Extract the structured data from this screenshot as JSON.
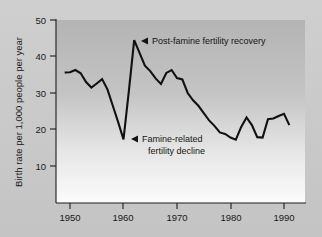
{
  "figure": {
    "background_color": "#c9c9c9",
    "plot_background_top": "#b6b6b6",
    "plot_background_bottom": "#fbfbfb",
    "line_color": "#111111",
    "axis_color": "#1a1a1a"
  },
  "chart_data": {
    "type": "line",
    "title": "",
    "subtitle": "",
    "xlabel": "",
    "ylabel": "Birth rate per 1,000 people per year",
    "xlim": [
      1948,
      1992
    ],
    "ylim": [
      0,
      50
    ],
    "ytick_labels": [
      "10",
      "20",
      "30",
      "40",
      "50"
    ],
    "ytick_values": [
      10,
      20,
      30,
      40,
      50
    ],
    "xtick_labels": [
      "1950",
      "1960",
      "1970",
      "1980",
      "1990"
    ],
    "xtick_values": [
      1950,
      1960,
      1970,
      1980,
      1990
    ],
    "grid": false,
    "legend": null,
    "series": [
      {
        "name": "Birth rate",
        "x": [
          1949,
          1950,
          1951,
          1952,
          1953,
          1954,
          1955,
          1956,
          1957,
          1958,
          1959,
          1960,
          1961,
          1962,
          1963,
          1964,
          1965,
          1966,
          1967,
          1968,
          1969,
          1970,
          1971,
          1972,
          1973,
          1974,
          1975,
          1976,
          1977,
          1978,
          1979,
          1980,
          1981,
          1982,
          1983,
          1984,
          1985,
          1986,
          1987,
          1988,
          1989,
          1990,
          1991
        ],
        "values": [
          35.6,
          35.7,
          36.3,
          35.4,
          33.0,
          31.5,
          32.6,
          33.8,
          31.0,
          26.5,
          22.0,
          17.3,
          30.5,
          44.5,
          41.0,
          37.5,
          36.0,
          34.0,
          32.5,
          35.5,
          36.3,
          34.1,
          33.7,
          30.0,
          28.0,
          26.5,
          24.5,
          22.5,
          21.0,
          19.2,
          18.8,
          17.8,
          17.2,
          20.7,
          23.3,
          21.2,
          17.9,
          17.8,
          22.8,
          23.0,
          23.7,
          24.3,
          21.2
        ]
      }
    ],
    "annotations": [
      {
        "id": "post-famine-recovery",
        "lines": [
          "Post-famine fertility recovery"
        ],
        "marker": "arrow-left",
        "points_to_x": 1962,
        "points_to_y": 44.5
      },
      {
        "id": "famine-related-decline",
        "lines": [
          "Famine-related",
          "fertility decline"
        ],
        "marker": "arrow-left",
        "points_to_x": 1960,
        "points_to_y": 17.3
      }
    ]
  }
}
